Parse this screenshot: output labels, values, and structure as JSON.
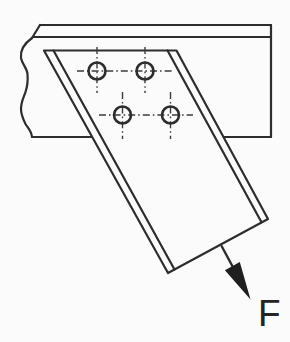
{
  "diagram": {
    "kind": "bolted-bracket-connection",
    "bolt_holes": {
      "count": 4
    }
  },
  "force": {
    "label": "F"
  },
  "colors": {
    "line": "#2d2d2d",
    "centerline": "#3c3c3c",
    "background": "#fbfbfb",
    "face_fill": "#fbfbfb",
    "arrow_fill": "#1f1f1f",
    "label_color": "#242424"
  }
}
